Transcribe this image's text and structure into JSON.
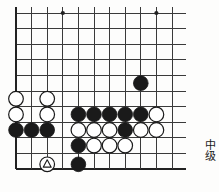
{
  "diagram": {
    "type": "go-board-problem",
    "board": {
      "cols": 11,
      "rows": 11,
      "origin_x": 16,
      "origin_y": 13,
      "spacing": 15.6,
      "line_color": "#3a3a3a",
      "edge_color": "#222222",
      "background": "#fdfdfc",
      "left_edge_is_border": true,
      "bottom_edge_is_border": true,
      "star_points": [
        {
          "col": 3,
          "row": 0
        },
        {
          "col": 9,
          "row": 0
        }
      ]
    },
    "stone_colors": {
      "black": "#1a1a1a",
      "white": "#ffffff",
      "stone_outline": "#1a1a1a",
      "marker": "#1a1a1a"
    },
    "stones": [
      {
        "col": 8,
        "row": 4.5,
        "color": "black"
      },
      {
        "col": 0,
        "row": 5.5,
        "color": "white"
      },
      {
        "col": 2,
        "row": 5.5,
        "color": "white"
      },
      {
        "col": 0,
        "row": 6.5,
        "color": "white"
      },
      {
        "col": 2,
        "row": 6.5,
        "color": "white"
      },
      {
        "col": 4,
        "row": 6.5,
        "color": "black"
      },
      {
        "col": 5,
        "row": 6.5,
        "color": "black"
      },
      {
        "col": 6,
        "row": 6.5,
        "color": "black"
      },
      {
        "col": 7,
        "row": 6.5,
        "color": "black"
      },
      {
        "col": 8,
        "row": 6.5,
        "color": "black"
      },
      {
        "col": 9,
        "row": 6.5,
        "color": "white"
      },
      {
        "col": 0,
        "row": 7.5,
        "color": "black"
      },
      {
        "col": 1,
        "row": 7.5,
        "color": "black"
      },
      {
        "col": 2,
        "row": 7.5,
        "color": "black"
      },
      {
        "col": 4,
        "row": 7.5,
        "color": "white"
      },
      {
        "col": 5,
        "row": 7.5,
        "color": "white"
      },
      {
        "col": 6,
        "row": 7.5,
        "color": "white"
      },
      {
        "col": 7,
        "row": 7.5,
        "color": "black"
      },
      {
        "col": 8,
        "row": 7.5,
        "color": "white"
      },
      {
        "col": 9,
        "row": 7.5,
        "color": "white"
      },
      {
        "col": 4,
        "row": 8.5,
        "color": "black"
      },
      {
        "col": 5,
        "row": 8.5,
        "color": "white"
      },
      {
        "col": 6,
        "row": 8.5,
        "color": "white"
      },
      {
        "col": 7,
        "row": 8.5,
        "color": "white"
      },
      {
        "col": 4,
        "row": 9.7,
        "color": "black"
      }
    ],
    "marked_stones": [
      {
        "col": 2,
        "row": 9.7,
        "color": "white",
        "marker": "triangle"
      }
    ],
    "rank_label": "中级"
  }
}
